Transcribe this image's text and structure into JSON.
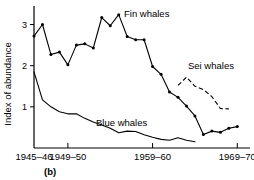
{
  "chart_data": {
    "type": "line",
    "title": "",
    "panel_label": "(b)",
    "xlabel": "",
    "ylabel": "Index of abundance",
    "ylim": [
      0,
      3.45
    ],
    "xlim": [
      1945,
      1970.5
    ],
    "grid": false,
    "legend_position": "inline-annotations",
    "yticks": [
      1,
      2,
      3
    ],
    "ytick_labels": [
      "1",
      "2",
      "3"
    ],
    "xticks": [
      1945,
      1949,
      1959,
      1969
    ],
    "xtick_labels": [
      "1945–46",
      "1949–50",
      "1959–60",
      "1969–70"
    ],
    "series": [
      {
        "name": "Fin whales",
        "style": "solid",
        "markers": true,
        "annotation": "Fin whales",
        "x": [
          1945,
          1946,
          1947,
          1948,
          1949,
          1950,
          1951,
          1952,
          1953,
          1954,
          1955,
          1956,
          1957,
          1958,
          1959,
          1960,
          1961,
          1962,
          1963,
          1964,
          1965,
          1966,
          1967,
          1968,
          1969
        ],
        "y": [
          2.72,
          3.0,
          2.27,
          2.33,
          2.02,
          2.5,
          2.53,
          2.43,
          3.17,
          2.97,
          3.24,
          2.71,
          2.63,
          2.63,
          1.98,
          1.79,
          1.36,
          1.23,
          1.02,
          0.78,
          0.33,
          0.41,
          0.38,
          0.48,
          0.52
        ]
      },
      {
        "name": "Blue whales",
        "style": "solid",
        "markers": false,
        "annotation": "Blue whales",
        "x": [
          1945,
          1946,
          1947,
          1948,
          1949,
          1950,
          1951,
          1952,
          1953,
          1954,
          1955,
          1956,
          1957,
          1958,
          1959,
          1960,
          1961,
          1962,
          1963,
          1964
        ],
        "y": [
          1.85,
          1.17,
          1.0,
          0.88,
          0.83,
          0.83,
          0.72,
          0.63,
          0.56,
          0.48,
          0.37,
          0.41,
          0.4,
          0.32,
          0.26,
          0.21,
          0.19,
          0.25,
          0.19,
          0.15
        ]
      },
      {
        "name": "Sei whales",
        "style": "dashed",
        "markers": false,
        "annotation": "Sei whales",
        "x": [
          1962,
          1963,
          1964,
          1965,
          1966,
          1967,
          1968
        ],
        "y": [
          1.52,
          1.72,
          1.5,
          1.42,
          1.25,
          0.96,
          0.95
        ]
      }
    ],
    "annotations": [
      {
        "text": "Fin whales",
        "x_px": 124,
        "y_px": 17
      },
      {
        "text": "Blue whales",
        "x_px": 96,
        "y_px": 126
      },
      {
        "text": "Sei whales",
        "x_px": 188,
        "y_px": 69
      }
    ]
  }
}
